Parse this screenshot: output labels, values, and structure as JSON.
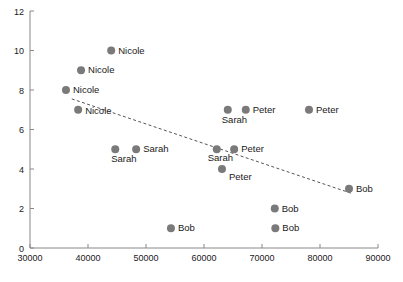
{
  "chart_data": {
    "type": "scatter",
    "title": "",
    "xlabel": "",
    "ylabel": "",
    "xlim": [
      30000,
      90000
    ],
    "ylim": [
      0,
      12
    ],
    "xticks": [
      30000,
      40000,
      50000,
      60000,
      70000,
      80000,
      90000
    ],
    "xticklabels": [
      "30000",
      "40000",
      "50000",
      "60000",
      "70000",
      "80000",
      "90000"
    ],
    "yticks": [
      0,
      2,
      4,
      6,
      8,
      10,
      12
    ],
    "yticklabels": [
      "0",
      "2",
      "4",
      "6",
      "8",
      "10",
      "12"
    ],
    "grid": false,
    "legend": false,
    "marker_color": "#7a7a7a",
    "marker_size": 4,
    "axis_color": "#888888",
    "text_color": "#1a1a1a",
    "points": [
      {
        "label": "Nicole",
        "x": 44000,
        "y": 10,
        "label_dx": 7,
        "label_dy": 3
      },
      {
        "label": "Nicole",
        "x": 38800,
        "y": 9,
        "label_dx": 7,
        "label_dy": 3
      },
      {
        "label": "Nicole",
        "x": 36200,
        "y": 8,
        "label_dx": 7,
        "label_dy": 3
      },
      {
        "label": "Nicole",
        "x": 38300,
        "y": 7,
        "label_dx": 7,
        "label_dy": 4
      },
      {
        "label": "Sarah",
        "x": 44700,
        "y": 5,
        "label_dx": -4,
        "label_dy": 13
      },
      {
        "label": "Sarah",
        "x": 48300,
        "y": 5,
        "label_dx": 7,
        "label_dy": 3
      },
      {
        "label": "Bob",
        "x": 54300,
        "y": 1,
        "label_dx": 7,
        "label_dy": 3
      },
      {
        "label": "Sarah",
        "x": 62200,
        "y": 5,
        "label_dx": -9,
        "label_dy": 12
      },
      {
        "label": "Peter",
        "x": 65200,
        "y": 5,
        "label_dx": 7,
        "label_dy": 3
      },
      {
        "label": "Peter",
        "x": 63100,
        "y": 4,
        "label_dx": 7,
        "label_dy": 11
      },
      {
        "label": "Sarah",
        "x": 64100,
        "y": 7,
        "label_dx": -6,
        "label_dy": 13
      },
      {
        "label": "Peter",
        "x": 67200,
        "y": 7,
        "label_dx": 7,
        "label_dy": 3
      },
      {
        "label": "Peter",
        "x": 78100,
        "y": 7,
        "label_dx": 7,
        "label_dy": 3
      },
      {
        "label": "Bob",
        "x": 72200,
        "y": 2,
        "label_dx": 7,
        "label_dy": 3
      },
      {
        "label": "Bob",
        "x": 72300,
        "y": 1,
        "label_dx": 7,
        "label_dy": 3
      },
      {
        "label": "Bob",
        "x": 85000,
        "y": 3,
        "label_dx": 7,
        "label_dy": 3
      }
    ],
    "trendline": {
      "style": "dashed",
      "color": "#555555",
      "x0": 37200,
      "y0": 7.55,
      "x1": 85600,
      "y1": 2.75
    }
  }
}
